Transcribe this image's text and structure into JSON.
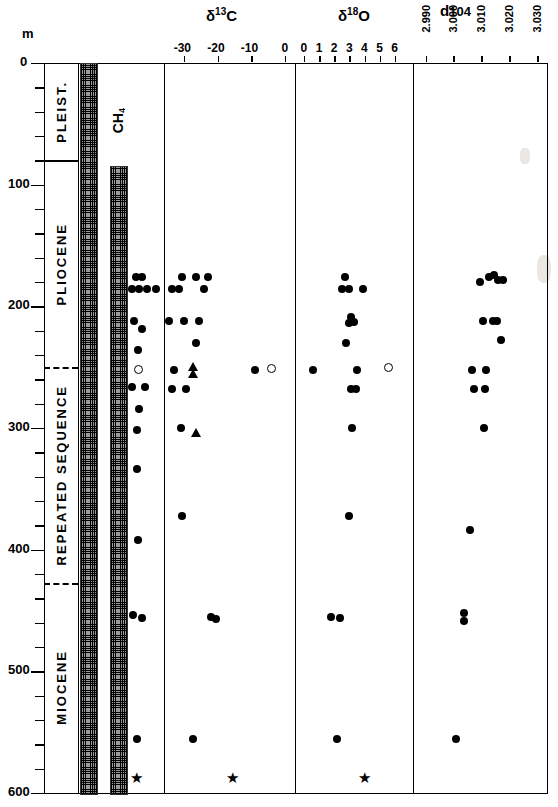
{
  "figure": {
    "depth_unit_label": "m",
    "depth_axis": {
      "min": 0,
      "max": 600,
      "labels": [
        "0",
        "100",
        "200",
        "300",
        "400",
        "500",
        "600"
      ],
      "minor_step": 20
    },
    "epochs": [
      {
        "name": "PLEIST.",
        "top": 0,
        "bottom": 80
      },
      {
        "name": "PLIOCENE",
        "top": 80,
        "bottom": 250
      },
      {
        "name": "REPEATED SEQUENCE",
        "top": 250,
        "bottom": 427
      },
      {
        "name": "MIOCENE",
        "top": 427,
        "bottom": 600
      }
    ],
    "gas_column": {
      "bars": [
        {
          "label": "H2S",
          "label_html": "H₂S",
          "top_depth": 0,
          "bottom_depth": 600
        },
        {
          "label": "CH4",
          "label_html": "CH₄",
          "top_depth": 85,
          "bottom_depth": 600
        }
      ]
    }
  },
  "chart_data": {
    "type": "scatter",
    "title": "",
    "ylabel": "m",
    "ylim": [
      0,
      600
    ],
    "grid": false,
    "legend": "none",
    "marker_types": [
      "filled-circle",
      "open-circle",
      "filled-triangle",
      "star"
    ],
    "panels": [
      {
        "id": "samples",
        "title": "",
        "xlabel": "",
        "xlim": [
          0,
          1
        ],
        "ticks": [],
        "points": [
          {
            "x": 0.22,
            "y": 176,
            "marker": "filled-circle"
          },
          {
            "x": 0.4,
            "y": 176,
            "marker": "filled-circle"
          },
          {
            "x": 0.1,
            "y": 186,
            "marker": "filled-circle"
          },
          {
            "x": 0.3,
            "y": 186,
            "marker": "filled-circle"
          },
          {
            "x": 0.52,
            "y": 186,
            "marker": "filled-circle"
          },
          {
            "x": 0.78,
            "y": 186,
            "marker": "filled-circle"
          },
          {
            "x": 0.18,
            "y": 212,
            "marker": "filled-circle"
          },
          {
            "x": 0.4,
            "y": 219,
            "marker": "filled-circle"
          },
          {
            "x": 0.28,
            "y": 236,
            "marker": "filled-circle"
          },
          {
            "x": 0.28,
            "y": 252,
            "marker": "open-circle"
          },
          {
            "x": 0.12,
            "y": 266,
            "marker": "filled-circle"
          },
          {
            "x": 0.46,
            "y": 266,
            "marker": "filled-circle"
          },
          {
            "x": 0.3,
            "y": 284,
            "marker": "filled-circle"
          },
          {
            "x": 0.26,
            "y": 302,
            "marker": "filled-circle"
          },
          {
            "x": 0.24,
            "y": 334,
            "marker": "filled-circle"
          },
          {
            "x": 0.28,
            "y": 392,
            "marker": "filled-circle"
          },
          {
            "x": 0.14,
            "y": 454,
            "marker": "filled-circle"
          },
          {
            "x": 0.4,
            "y": 456,
            "marker": "filled-circle"
          },
          {
            "x": 0.26,
            "y": 556,
            "marker": "filled-circle"
          },
          {
            "x": 0.26,
            "y": 588,
            "marker": "star"
          }
        ]
      },
      {
        "id": "d13C",
        "title": "δ¹³C",
        "title_main": "δ",
        "title_sup": "13",
        "title_tail": "C",
        "xlabel": "",
        "xlim": [
          -36,
          3
        ],
        "ticks": [
          -30,
          -20,
          -10,
          0
        ],
        "tick_labels": [
          "-30",
          "-20",
          "-10",
          "0"
        ],
        "points": [
          {
            "x": -30.5,
            "y": 176,
            "marker": "filled-circle"
          },
          {
            "x": -26.5,
            "y": 176,
            "marker": "filled-circle"
          },
          {
            "x": -23.0,
            "y": 176,
            "marker": "filled-circle"
          },
          {
            "x": -33.5,
            "y": 186,
            "marker": "filled-circle"
          },
          {
            "x": -31.5,
            "y": 186,
            "marker": "filled-circle"
          },
          {
            "x": -24.0,
            "y": 186,
            "marker": "filled-circle"
          },
          {
            "x": -34.5,
            "y": 212,
            "marker": "filled-circle"
          },
          {
            "x": -30.0,
            "y": 212,
            "marker": "filled-circle"
          },
          {
            "x": -25.5,
            "y": 212,
            "marker": "filled-circle"
          },
          {
            "x": -26.5,
            "y": 230,
            "marker": "filled-circle"
          },
          {
            "x": -33.0,
            "y": 252,
            "marker": "filled-circle"
          },
          {
            "x": -27.5,
            "y": 250,
            "marker": "filled-triangle"
          },
          {
            "x": -27.5,
            "y": 256,
            "marker": "filled-triangle"
          },
          {
            "x": -9.0,
            "y": 252,
            "marker": "filled-circle"
          },
          {
            "x": -4.0,
            "y": 251,
            "marker": "open-circle"
          },
          {
            "x": -33.5,
            "y": 268,
            "marker": "filled-circle"
          },
          {
            "x": -29.5,
            "y": 268,
            "marker": "filled-circle"
          },
          {
            "x": -31.0,
            "y": 300,
            "marker": "filled-circle"
          },
          {
            "x": -26.5,
            "y": 304,
            "marker": "filled-triangle"
          },
          {
            "x": -30.5,
            "y": 372,
            "marker": "filled-circle"
          },
          {
            "x": -22.0,
            "y": 455,
            "marker": "filled-circle"
          },
          {
            "x": -20.5,
            "y": 457,
            "marker": "filled-circle"
          },
          {
            "x": -27.5,
            "y": 556,
            "marker": "filled-circle"
          },
          {
            "x": -15.5,
            "y": 588,
            "marker": "star"
          }
        ]
      },
      {
        "id": "d18O",
        "title": "δ¹⁸O",
        "title_main": "δ",
        "title_sup": "18",
        "title_tail": "O",
        "xlabel": "",
        "xlim": [
          -0.6,
          7.2
        ],
        "ticks": [
          0,
          1,
          2,
          3,
          4,
          5,
          6
        ],
        "tick_labels": [
          "0",
          "1",
          "2",
          "3",
          "4",
          "5",
          "6"
        ],
        "points": [
          {
            "x": 2.7,
            "y": 176,
            "marker": "filled-circle"
          },
          {
            "x": 2.5,
            "y": 186,
            "marker": "filled-circle"
          },
          {
            "x": 3.0,
            "y": 186,
            "marker": "filled-circle"
          },
          {
            "x": 3.9,
            "y": 186,
            "marker": "filled-circle"
          },
          {
            "x": 3.1,
            "y": 209,
            "marker": "filled-circle"
          },
          {
            "x": 3.3,
            "y": 213,
            "marker": "filled-circle"
          },
          {
            "x": 3.0,
            "y": 214,
            "marker": "filled-circle"
          },
          {
            "x": 2.8,
            "y": 230,
            "marker": "filled-circle"
          },
          {
            "x": 0.6,
            "y": 252,
            "marker": "filled-circle"
          },
          {
            "x": 3.5,
            "y": 252,
            "marker": "filled-circle"
          },
          {
            "x": 5.6,
            "y": 250,
            "marker": "open-circle"
          },
          {
            "x": 3.1,
            "y": 268,
            "marker": "filled-circle"
          },
          {
            "x": 3.4,
            "y": 268,
            "marker": "filled-circle"
          },
          {
            "x": 3.2,
            "y": 300,
            "marker": "filled-circle"
          },
          {
            "x": 3.0,
            "y": 372,
            "marker": "filled-circle"
          },
          {
            "x": 1.8,
            "y": 455,
            "marker": "filled-circle"
          },
          {
            "x": 2.4,
            "y": 456,
            "marker": "filled-circle"
          },
          {
            "x": 2.2,
            "y": 556,
            "marker": "filled-circle"
          },
          {
            "x": 4.0,
            "y": 588,
            "marker": "star"
          }
        ]
      },
      {
        "id": "d104",
        "title": "d104",
        "title_main": "d",
        "title_sup": "",
        "title_tail": "104",
        "xlabel": "",
        "xlim": [
          2.9855,
          3.0335
        ],
        "ticks": [
          2.99,
          3.0,
          3.01,
          3.02,
          3.03
        ],
        "tick_labels": [
          "2.990",
          "3.000",
          "3.010",
          "3.020",
          "3.030"
        ],
        "points": [
          {
            "x": 3.0128,
            "y": 176,
            "marker": "filled-circle"
          },
          {
            "x": 3.0145,
            "y": 174,
            "marker": "filled-circle"
          },
          {
            "x": 3.0158,
            "y": 178,
            "marker": "filled-circle"
          },
          {
            "x": 3.0178,
            "y": 178,
            "marker": "filled-circle"
          },
          {
            "x": 3.0095,
            "y": 180,
            "marker": "filled-circle"
          },
          {
            "x": 3.0104,
            "y": 212,
            "marker": "filled-circle"
          },
          {
            "x": 3.0143,
            "y": 212,
            "marker": "filled-circle"
          },
          {
            "x": 3.0156,
            "y": 212,
            "marker": "filled-circle"
          },
          {
            "x": 3.0172,
            "y": 228,
            "marker": "filled-circle"
          },
          {
            "x": 3.0068,
            "y": 252,
            "marker": "filled-circle"
          },
          {
            "x": 3.0118,
            "y": 252,
            "marker": "filled-circle"
          },
          {
            "x": 3.0072,
            "y": 268,
            "marker": "filled-circle"
          },
          {
            "x": 3.0113,
            "y": 268,
            "marker": "filled-circle"
          },
          {
            "x": 3.0108,
            "y": 300,
            "marker": "filled-circle"
          },
          {
            "x": 3.006,
            "y": 384,
            "marker": "filled-circle"
          },
          {
            "x": 3.0036,
            "y": 452,
            "marker": "filled-circle"
          },
          {
            "x": 3.0036,
            "y": 459,
            "marker": "filled-circle"
          },
          {
            "x": 3.0009,
            "y": 556,
            "marker": "filled-circle"
          }
        ]
      }
    ]
  }
}
